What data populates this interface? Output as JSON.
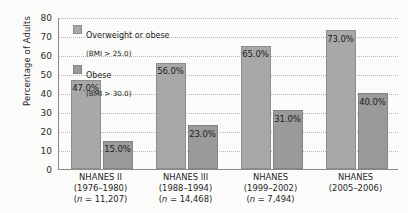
{
  "chart_data": {
    "type": "bar",
    "title": "",
    "xlabel": "",
    "ylabel": "Percentage of Adults",
    "ylim": [
      0,
      80
    ],
    "ytick_step": 10,
    "yticks": [
      "80",
      "70",
      "60",
      "50",
      "40",
      "30",
      "20",
      "10",
      "0"
    ],
    "grid": "horizontal dotted",
    "legend_position": "inside top-left",
    "categories": [
      "NHANES II (1976–1980)",
      "NHANES III (1988–1994)",
      "NHANES (1999–2002)",
      "NHANES (2005–2006)"
    ],
    "series": [
      {
        "name": "Overweight or obese (BMI > 25.0)",
        "color": "#a8a8a8",
        "values": [
          47.0,
          56.0,
          65.0,
          73.0
        ],
        "labels": [
          "47.0%",
          "56.0%",
          "65.0%",
          "73.0%"
        ]
      },
      {
        "name": "Obese (BMI > 30.0)",
        "color": "#9a9a9a",
        "values": [
          15.0,
          23.0,
          31.0,
          40.0
        ],
        "labels": [
          "15.0%",
          "23.0%",
          "31.0%",
          "40.0%"
        ]
      }
    ]
  },
  "axis": {
    "y_title": "Percentage of Adults"
  },
  "legend": {
    "items": [
      {
        "label": "Overweight or obese",
        "sublabel": "(BMI > 25.0)",
        "swatch": "legend-swatch-overweight"
      },
      {
        "label": "Obese",
        "sublabel": "(BMI > 30.0)",
        "swatch": "legend-swatch-obese"
      }
    ]
  },
  "x_groups": [
    {
      "name": "NHANES II",
      "period": "(1976–1980)",
      "n": "(n = 11,207)"
    },
    {
      "name": "NHANES III",
      "period": "(1988–1994)",
      "n": "(n = 14,468)"
    },
    {
      "name": "NHANES",
      "period": "(1999–2002)",
      "n": "(n = 7,494)"
    },
    {
      "name": "NHANES",
      "period": "(2005–2006)",
      "n": ""
    }
  ]
}
